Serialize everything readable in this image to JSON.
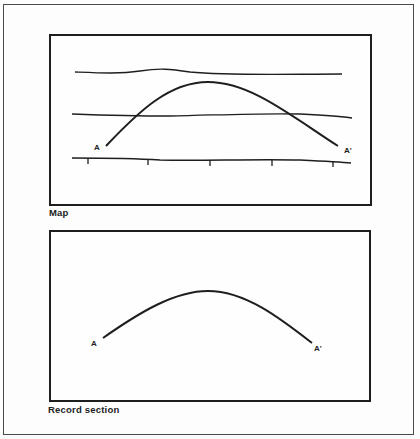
{
  "figure": {
    "panels": [
      {
        "id": "map",
        "caption": "Map",
        "elements": {
          "horizontal_lines": 3,
          "curve": "arch from A to A'",
          "tick_marks_on_bottom_line": 5
        },
        "labels": {
          "start": "A",
          "end": "A'"
        }
      },
      {
        "id": "record",
        "caption": "Record section",
        "elements": {
          "curve": "arch from A to A'"
        },
        "labels": {
          "start": "A",
          "end": "A'"
        }
      }
    ]
  },
  "colors": {
    "ink": "#1e1e1e",
    "background": "#fdfdfd"
  }
}
